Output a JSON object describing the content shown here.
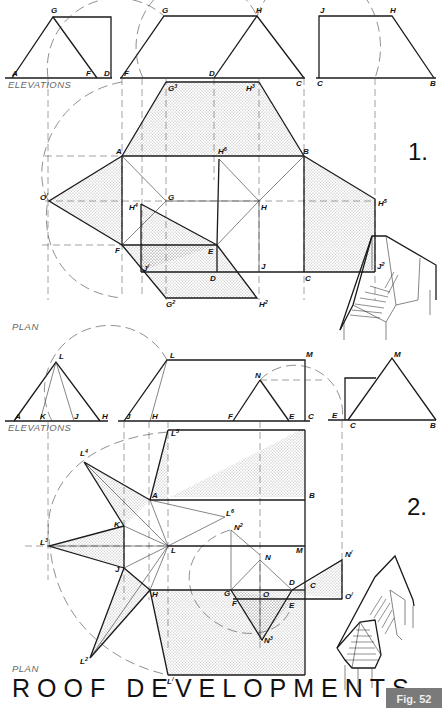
{
  "title": "ROOF DEVELOPMENTS",
  "figure_label": "Fig. 52",
  "figure1": {
    "number": "1.",
    "elevations_label": "ELEVATIONS",
    "plan_label": "PLAN",
    "labels": {
      "G": "G",
      "A": "A",
      "F": "F",
      "D": "D",
      "H": "H",
      "C": "C",
      "J": "J",
      "B": "B",
      "G3": "G",
      "H3": "H",
      "H6": "H",
      "O1": "O",
      "H4": "H",
      "E": "E",
      "H5": "H",
      "J1": "J",
      "J2": "J",
      "G2": "G",
      "H2": "H"
    },
    "superscripts": {
      "G3": "3",
      "H3": "3",
      "H6": "6",
      "O1": "/",
      "H4": "4",
      "H5": "5",
      "J1": "/",
      "J2": "2",
      "G2": "2",
      "H2": "2"
    }
  },
  "figure2": {
    "number": "2.",
    "elevations_label": "ELEVATIONS",
    "plan_label": "PLAN",
    "labels": {
      "L": "L",
      "A": "A",
      "K": "K",
      "J": "J",
      "H": "H",
      "M": "M",
      "N": "N",
      "F": "F",
      "E": "E",
      "C": "C",
      "B": "B",
      "L5": "L",
      "L4": "L",
      "L6": "L",
      "N2": "N",
      "L3": "L",
      "G": "G",
      "O": "O",
      "D": "D",
      "N1": "N",
      "O1": "O",
      "L2": "L",
      "N3": "N",
      "L1": "L"
    },
    "superscripts": {
      "L5": "5",
      "L4": "4",
      "L6": "6",
      "N2": "2",
      "L3": "3",
      "N1": "/",
      "O1": "/",
      "L2": "2",
      "N3": "3",
      "L1": "/"
    }
  },
  "colors": {
    "ink": "#1a1a1a",
    "paper": "#ffffff",
    "badge": "#7a7a7a"
  }
}
